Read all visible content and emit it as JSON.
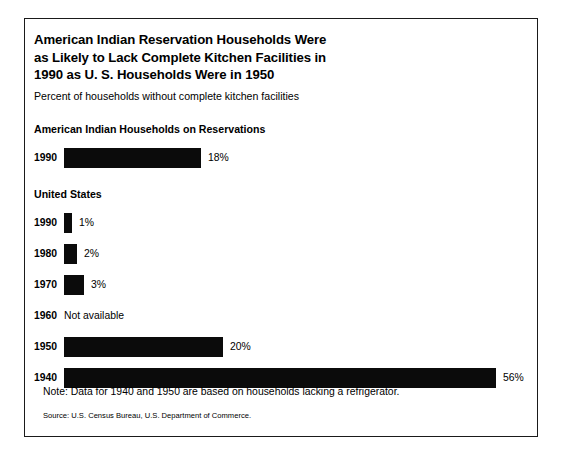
{
  "chart_data": {
    "type": "bar",
    "orientation": "horizontal",
    "title": "American Indian Reservation Households Were as Likely to Lack Complete Kitchen Facilities in 1990 as U. S. Households Were in 1950",
    "title_lines": [
      "American Indian Reservation Households Were",
      "as Likely to Lack Complete Kitchen Facilities in",
      "1990 as U. S. Households Were in 1950"
    ],
    "subtitle": "Percent of households without complete kitchen facilities",
    "xlabel": "",
    "ylabel": "",
    "grid": false,
    "legend": false,
    "units": "percent",
    "xlim": [
      0,
      56
    ],
    "groups": [
      {
        "name": "american-indian-households-on-reservations",
        "header": "American Indian Households on Reservations",
        "categories": [
          "1990"
        ],
        "values": [
          18
        ],
        "labels": [
          "18%"
        ],
        "bar_widths_px": [
          137
        ]
      },
      {
        "name": "united-states",
        "header": "United States",
        "categories": [
          "1990",
          "1980",
          "1970",
          "1960",
          "1950",
          "1940"
        ],
        "values": [
          1,
          2,
          3,
          null,
          20,
          56
        ],
        "labels": [
          "1%",
          "2%",
          "3%",
          "Not available",
          "20%",
          "56%"
        ],
        "bar_widths_px": [
          8,
          13,
          20,
          0,
          159,
          432
        ]
      }
    ],
    "note": "Note:  Data for 1940 and 1950 are based on households lacking a refrigerator.",
    "source": "Source:  U.S. Census Bureau, U.S. Department of Commerce.",
    "colors": {
      "bar": "#0b0b0b",
      "background": "#ffffff",
      "text": "#000000",
      "frame": "#1a1a1a"
    }
  }
}
